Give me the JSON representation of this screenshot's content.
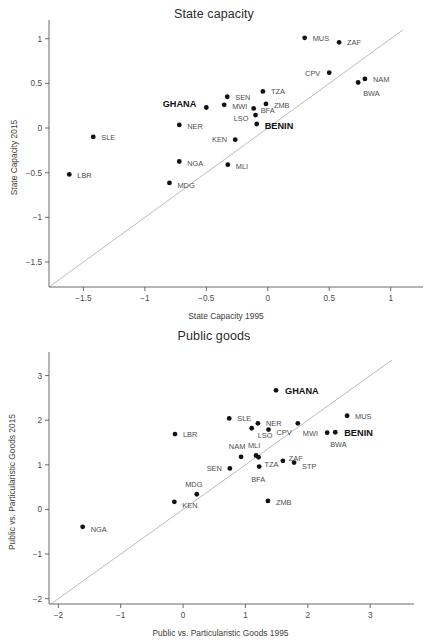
{
  "page": {
    "background": "#ffffff",
    "marker_color": "#121212",
    "axis_color": "#5a5a5a",
    "reference_line_color": "#b4b4b4",
    "highlight_color": "#111111"
  },
  "chart_data": [
    {
      "id": "state-capacity",
      "type": "scatter",
      "title": "State capacity",
      "xlabel": "State Capacity 1995",
      "ylabel": "State Capacity 2015",
      "xlim": [
        -1.78,
        1.1
      ],
      "ylim": [
        -1.78,
        1.12
      ],
      "xticks": [
        -1.5,
        -1,
        -0.5,
        0,
        0.5,
        1
      ],
      "xticklabels": [
        "−1.5",
        "−1",
        "−0.5",
        "0",
        "0.5",
        "1"
      ],
      "yticks": [
        1,
        0.5,
        0,
        -0.5,
        -1,
        -1.5
      ],
      "yticklabels": [
        "1",
        "0.5",
        "0",
        "−0.5",
        "−1",
        "−1.5"
      ],
      "grid": false,
      "legend": "none",
      "reference_line": {
        "type": "identity",
        "label": "y = x"
      },
      "points": [
        {
          "label": "MUS",
          "x": 0.3,
          "y": 1.01,
          "lx": 8,
          "ly": 3,
          "highlight": false
        },
        {
          "label": "ZAF",
          "x": 0.58,
          "y": 0.96,
          "lx": 8,
          "ly": 3,
          "highlight": false
        },
        {
          "label": "CPV",
          "x": 0.5,
          "y": 0.62,
          "lx": -9,
          "ly": 3,
          "anchor": "end",
          "highlight": false
        },
        {
          "label": "NAM",
          "x": 0.79,
          "y": 0.55,
          "lx": 8,
          "ly": 3,
          "highlight": false
        },
        {
          "label": "BWA",
          "x": 0.735,
          "y": 0.51,
          "lx": 5,
          "ly": 14,
          "highlight": false
        },
        {
          "label": "TZA",
          "x": -0.04,
          "y": 0.41,
          "lx": 8,
          "ly": 3,
          "highlight": false
        },
        {
          "label": "SEN",
          "x": -0.33,
          "y": 0.35,
          "lx": 8,
          "ly": 3,
          "highlight": false
        },
        {
          "label": "GHANA",
          "x": -0.5,
          "y": 0.23,
          "lx": -10,
          "ly": 0,
          "anchor": "end",
          "highlight": true
        },
        {
          "label": "MWI",
          "x": -0.355,
          "y": 0.26,
          "lx": 8,
          "ly": 4,
          "highlight": false
        },
        {
          "label": "ZMB",
          "x": -0.015,
          "y": 0.27,
          "lx": 8,
          "ly": 4,
          "highlight": false
        },
        {
          "label": "BFA",
          "x": -0.115,
          "y": 0.22,
          "lx": 7,
          "ly": 5,
          "highlight": false
        },
        {
          "label": "LSO",
          "x": -0.1,
          "y": 0.145,
          "lx": -7,
          "ly": 6,
          "anchor": "end",
          "highlight": false
        },
        {
          "label": "BENIN",
          "x": -0.09,
          "y": 0.045,
          "lx": 8,
          "ly": 5,
          "highlight": true
        },
        {
          "label": "NER",
          "x": -0.72,
          "y": 0.035,
          "lx": 8,
          "ly": 4,
          "highlight": false
        },
        {
          "label": "SLE",
          "x": -1.42,
          "y": -0.1,
          "lx": 8,
          "ly": 3,
          "highlight": false
        },
        {
          "label": "KEN",
          "x": -0.265,
          "y": -0.13,
          "lx": -8,
          "ly": 2,
          "anchor": "end",
          "highlight": false
        },
        {
          "label": "NGA",
          "x": -0.72,
          "y": -0.375,
          "lx": 8,
          "ly": 4,
          "highlight": false
        },
        {
          "label": "MLI",
          "x": -0.325,
          "y": -0.41,
          "lx": 8,
          "ly": 4,
          "highlight": false
        },
        {
          "label": "LBR",
          "x": -1.615,
          "y": -0.52,
          "lx": 8,
          "ly": 4,
          "highlight": false
        },
        {
          "label": "MDG",
          "x": -0.8,
          "y": -0.615,
          "lx": 8,
          "ly": 5,
          "highlight": false
        }
      ]
    },
    {
      "id": "public-goods",
      "type": "scatter",
      "title": "Public goods",
      "xlabel": "Public vs. Particularistic Goods 1995",
      "ylabel": "Public vs. Particularistic Goods 2015",
      "xlim": [
        -2.15,
        3.35
      ],
      "ylim": [
        -2.12,
        3.35
      ],
      "xticks": [
        -2,
        -1,
        0,
        1,
        2,
        3
      ],
      "xticklabels": [
        "−2",
        "−1",
        "0",
        "1",
        "2",
        "3"
      ],
      "yticks": [
        3,
        2,
        1,
        0,
        -1,
        -2
      ],
      "yticklabels": [
        "3",
        "2",
        "1",
        "0",
        "−1",
        "−2"
      ],
      "grid": false,
      "legend": "none",
      "reference_line": {
        "type": "identity",
        "label": "y = x"
      },
      "points": [
        {
          "label": "GHANA",
          "x": 1.49,
          "y": 2.67,
          "lx": 9,
          "ly": 4,
          "highlight": true
        },
        {
          "label": "MUS",
          "x": 2.63,
          "y": 2.1,
          "lx": 8,
          "ly": 3,
          "highlight": false
        },
        {
          "label": "SLE",
          "x": 0.74,
          "y": 2.04,
          "lx": 8,
          "ly": 3,
          "highlight": false
        },
        {
          "label": "NER",
          "x": 1.2,
          "y": 1.93,
          "lx": 8,
          "ly": 3,
          "highlight": false
        },
        {
          "label": "MWI",
          "x": 1.84,
          "y": 1.93,
          "lx": 5,
          "ly": 13,
          "highlight": false
        },
        {
          "label": "LSO",
          "x": 1.1,
          "y": 1.82,
          "lx": 6,
          "ly": 10,
          "highlight": false
        },
        {
          "label": "CPV",
          "x": 1.37,
          "y": 1.79,
          "lx": 8,
          "ly": 5,
          "highlight": false
        },
        {
          "label": "BENIN",
          "x": 2.44,
          "y": 1.73,
          "lx": 9,
          "ly": 4,
          "highlight": true
        },
        {
          "label": "BWA",
          "x": 2.31,
          "y": 1.72,
          "lx": 3,
          "ly": 14,
          "highlight": false
        },
        {
          "label": "LBR",
          "x": -0.13,
          "y": 1.69,
          "lx": 8,
          "ly": 3,
          "highlight": false
        },
        {
          "label": "MLI",
          "x": 1.17,
          "y": 1.21,
          "lx": -2,
          "ly": -7,
          "anchor": "middle",
          "highlight": false
        },
        {
          "label": "NAM",
          "x": 0.93,
          "y": 1.18,
          "lx": -4,
          "ly": -8,
          "anchor": "middle",
          "highlight": false
        },
        {
          "label": "TZA",
          "x": 1.21,
          "y": 1.17,
          "lx": 6,
          "ly": 10,
          "highlight": false
        },
        {
          "label": "ZAF",
          "x": 1.6,
          "y": 1.09,
          "lx": 6,
          "ly": 0,
          "highlight": false
        },
        {
          "label": "STP",
          "x": 1.78,
          "y": 1.05,
          "lx": 8,
          "ly": 6,
          "highlight": false
        },
        {
          "label": "BFA",
          "x": 1.22,
          "y": 0.96,
          "lx": -1,
          "ly": 15,
          "anchor": "middle",
          "highlight": false
        },
        {
          "label": "SEN",
          "x": 0.75,
          "y": 0.92,
          "lx": -8,
          "ly": 3,
          "anchor": "end",
          "highlight": false
        },
        {
          "label": "MDG",
          "x": 0.22,
          "y": 0.34,
          "lx": -3,
          "ly": -7,
          "anchor": "middle",
          "highlight": false
        },
        {
          "label": "KEN",
          "x": -0.14,
          "y": 0.17,
          "lx": 8,
          "ly": 6,
          "highlight": false
        },
        {
          "label": "ZMB",
          "x": 1.36,
          "y": 0.19,
          "lx": 8,
          "ly": 4,
          "highlight": false
        },
        {
          "label": "NGA",
          "x": -1.61,
          "y": -0.39,
          "lx": 8,
          "ly": 5,
          "highlight": false
        }
      ]
    }
  ]
}
